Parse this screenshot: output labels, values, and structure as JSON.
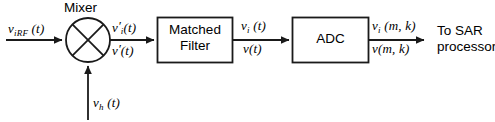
{
  "diagram": {
    "stroke_color": "#1a1a1a",
    "background_color": "#ffffff",
    "mixer": {
      "title": "Mixer",
      "shape": "circle-with-x"
    },
    "blocks": [
      {
        "name": "matched-filter",
        "line1": "Matched",
        "line2": "Filter"
      },
      {
        "name": "adc",
        "line1": "ADC",
        "line2": ""
      }
    ],
    "signals": {
      "rf_input": {
        "base": "v",
        "sub": "iRF",
        "arg": "(t)"
      },
      "lo_input": {
        "base": "v",
        "sub": "h",
        "arg": "(t)"
      },
      "mixer_out_i": {
        "base": "v",
        "prime": "′",
        "sub": "i",
        "arg": "(t)"
      },
      "mixer_out_q": {
        "base": "v",
        "prime": "′",
        "sub": "",
        "arg": "(t)"
      },
      "filter_out_i": {
        "base": "v",
        "sub": "i",
        "arg": "(t)"
      },
      "filter_out_q": {
        "base": "v",
        "sub": "",
        "arg": "(t)"
      },
      "adc_out_i": {
        "base": "v",
        "sub": "i",
        "arg": "(m, k)"
      },
      "adc_out_q": {
        "base": "v",
        "sub": "",
        "arg": "(m, k)"
      }
    },
    "destination": {
      "line1": "To SAR",
      "line2": "processor"
    }
  }
}
